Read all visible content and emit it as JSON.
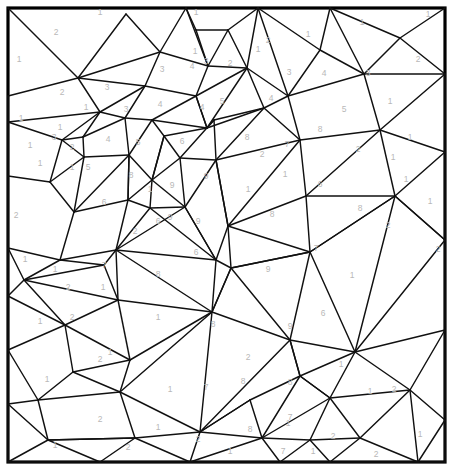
{
  "document": {
    "kind": "color-by-number-coloring-page",
    "title": "Color By Number Mosaic Grid",
    "canvas": {
      "width": 453,
      "height": 475,
      "background_color": "#ffffff"
    },
    "frame": {
      "x": 8,
      "y": 8,
      "width": 437,
      "height": 454,
      "stroke_color": "#000000",
      "stroke_width": 3.2,
      "fill_color": "#ffffff"
    },
    "style": {
      "edge_color": "#111111",
      "edge_width": 1.45,
      "number_color": "#b8b8b8",
      "number_font_size": 8.5
    },
    "palette_values": [
      "1",
      "2",
      "3",
      "4",
      "5",
      "6",
      "7",
      "8",
      "9"
    ]
  },
  "edges": [
    [
      8,
      8,
      78,
      78
    ],
    [
      78,
      78,
      8,
      96
    ],
    [
      78,
      78,
      126,
      14
    ],
    [
      126,
      14,
      160,
      52
    ],
    [
      160,
      52,
      78,
      78
    ],
    [
      160,
      52,
      186,
      8
    ],
    [
      160,
      52,
      208,
      66
    ],
    [
      208,
      66,
      186,
      8
    ],
    [
      186,
      8,
      196,
      30
    ],
    [
      196,
      30,
      208,
      66
    ],
    [
      196,
      30,
      228,
      30
    ],
    [
      228,
      30,
      208,
      66
    ],
    [
      228,
      30,
      258,
      8
    ],
    [
      228,
      30,
      247,
      68
    ],
    [
      247,
      68,
      208,
      66
    ],
    [
      208,
      66,
      196,
      96
    ],
    [
      196,
      96,
      247,
      68
    ],
    [
      196,
      96,
      207,
      128
    ],
    [
      207,
      128,
      247,
      68
    ],
    [
      247,
      68,
      264,
      108
    ],
    [
      264,
      108,
      207,
      128
    ],
    [
      207,
      128,
      196,
      96
    ],
    [
      160,
      52,
      145,
      86
    ],
    [
      145,
      86,
      196,
      96
    ],
    [
      145,
      86,
      78,
      78
    ],
    [
      145,
      86,
      100,
      112
    ],
    [
      100,
      112,
      78,
      78
    ],
    [
      100,
      112,
      8,
      122
    ],
    [
      8,
      96,
      8,
      122
    ],
    [
      100,
      112,
      125,
      118
    ],
    [
      125,
      118,
      145,
      86
    ],
    [
      125,
      118,
      152,
      120
    ],
    [
      152,
      120,
      196,
      96
    ],
    [
      152,
      120,
      207,
      128
    ],
    [
      8,
      122,
      62,
      140
    ],
    [
      62,
      140,
      100,
      112
    ],
    [
      62,
      140,
      83,
      137
    ],
    [
      83,
      137,
      100,
      112
    ],
    [
      83,
      137,
      125,
      118
    ],
    [
      83,
      137,
      84,
      157
    ],
    [
      84,
      157,
      62,
      140
    ],
    [
      84,
      157,
      129,
      155
    ],
    [
      129,
      155,
      125,
      118
    ],
    [
      129,
      155,
      152,
      120
    ],
    [
      62,
      140,
      50,
      182
    ],
    [
      50,
      182,
      84,
      157
    ],
    [
      50,
      182,
      8,
      176
    ],
    [
      8,
      122,
      8,
      176
    ],
    [
      50,
      182,
      74,
      212
    ],
    [
      74,
      212,
      84,
      157
    ],
    [
      74,
      212,
      129,
      155
    ],
    [
      129,
      155,
      128,
      200
    ],
    [
      128,
      200,
      74,
      212
    ],
    [
      128,
      200,
      129,
      155
    ],
    [
      152,
      120,
      164,
      136
    ],
    [
      164,
      136,
      207,
      128
    ],
    [
      164,
      136,
      152,
      180
    ],
    [
      152,
      180,
      129,
      155
    ],
    [
      152,
      180,
      128,
      200
    ],
    [
      152,
      180,
      164,
      136
    ],
    [
      207,
      128,
      214,
      120
    ],
    [
      214,
      120,
      264,
      108
    ],
    [
      264,
      108,
      288,
      96
    ],
    [
      288,
      96,
      247,
      68
    ],
    [
      288,
      96,
      258,
      8
    ],
    [
      258,
      8,
      247,
      68
    ],
    [
      288,
      96,
      320,
      50
    ],
    [
      320,
      50,
      258,
      8
    ],
    [
      320,
      50,
      330,
      8
    ],
    [
      320,
      50,
      364,
      74
    ],
    [
      364,
      74,
      288,
      96
    ],
    [
      330,
      8,
      364,
      74
    ],
    [
      364,
      74,
      400,
      38
    ],
    [
      400,
      38,
      330,
      8
    ],
    [
      400,
      38,
      445,
      8
    ],
    [
      400,
      38,
      445,
      74
    ],
    [
      445,
      74,
      364,
      74
    ],
    [
      364,
      74,
      380,
      130
    ],
    [
      380,
      130,
      445,
      74
    ],
    [
      445,
      74,
      445,
      118
    ],
    [
      380,
      130,
      445,
      152
    ],
    [
      445,
      118,
      445,
      152
    ],
    [
      288,
      96,
      300,
      140
    ],
    [
      300,
      140,
      380,
      130
    ],
    [
      300,
      140,
      264,
      108
    ],
    [
      214,
      120,
      216,
      160
    ],
    [
      216,
      160,
      264,
      108
    ],
    [
      216,
      160,
      300,
      140
    ],
    [
      214,
      120,
      180,
      158
    ],
    [
      180,
      158,
      216,
      160
    ],
    [
      180,
      158,
      164,
      136
    ],
    [
      180,
      158,
      152,
      180
    ],
    [
      180,
      158,
      185,
      207
    ],
    [
      185,
      207,
      152,
      180
    ],
    [
      185,
      207,
      216,
      160
    ],
    [
      152,
      180,
      150,
      208
    ],
    [
      150,
      208,
      185,
      207
    ],
    [
      150,
      208,
      128,
      200
    ],
    [
      128,
      200,
      116,
      250
    ],
    [
      116,
      250,
      150,
      208
    ],
    [
      116,
      250,
      185,
      207
    ],
    [
      74,
      212,
      60,
      260
    ],
    [
      60,
      260,
      116,
      250
    ],
    [
      60,
      260,
      8,
      248
    ],
    [
      8,
      176,
      8,
      248
    ],
    [
      8,
      248,
      24,
      280
    ],
    [
      24,
      280,
      60,
      260
    ],
    [
      60,
      260,
      104,
      265
    ],
    [
      104,
      265,
      116,
      250
    ],
    [
      24,
      280,
      104,
      265
    ],
    [
      104,
      265,
      118,
      300
    ],
    [
      118,
      300,
      24,
      280
    ],
    [
      24,
      280,
      8,
      296
    ],
    [
      8,
      248,
      8,
      296
    ],
    [
      8,
      296,
      65,
      325
    ],
    [
      65,
      325,
      118,
      300
    ],
    [
      65,
      325,
      24,
      280
    ],
    [
      185,
      207,
      216,
      260
    ],
    [
      216,
      260,
      150,
      208
    ],
    [
      216,
      260,
      116,
      250
    ],
    [
      216,
      260,
      185,
      207
    ],
    [
      216,
      160,
      228,
      226
    ],
    [
      228,
      226,
      300,
      140
    ],
    [
      228,
      226,
      216,
      260
    ],
    [
      228,
      226,
      216,
      160
    ],
    [
      300,
      140,
      306,
      196
    ],
    [
      306,
      196,
      228,
      226
    ],
    [
      306,
      196,
      380,
      130
    ],
    [
      380,
      130,
      395,
      196
    ],
    [
      395,
      196,
      306,
      196
    ],
    [
      395,
      196,
      445,
      152
    ],
    [
      445,
      152,
      445,
      240
    ],
    [
      395,
      196,
      445,
      240
    ],
    [
      306,
      196,
      310,
      252
    ],
    [
      310,
      252,
      395,
      196
    ],
    [
      310,
      252,
      228,
      226
    ],
    [
      228,
      226,
      231,
      268
    ],
    [
      231,
      268,
      310,
      252
    ],
    [
      231,
      268,
      216,
      260
    ],
    [
      216,
      260,
      212,
      312
    ],
    [
      212,
      312,
      231,
      268
    ],
    [
      212,
      312,
      116,
      250
    ],
    [
      116,
      250,
      118,
      300
    ],
    [
      118,
      300,
      212,
      312
    ],
    [
      118,
      300,
      130,
      360
    ],
    [
      130,
      360,
      212,
      312
    ],
    [
      65,
      325,
      130,
      360
    ],
    [
      65,
      325,
      73,
      372
    ],
    [
      73,
      372,
      130,
      360
    ],
    [
      8,
      296,
      8,
      350
    ],
    [
      8,
      350,
      65,
      325
    ],
    [
      8,
      350,
      38,
      400
    ],
    [
      38,
      400,
      73,
      372
    ],
    [
      38,
      400,
      8,
      404
    ],
    [
      8,
      350,
      8,
      404
    ],
    [
      38,
      400,
      120,
      392
    ],
    [
      120,
      392,
      73,
      372
    ],
    [
      120,
      392,
      130,
      360
    ],
    [
      8,
      404,
      48,
      440
    ],
    [
      48,
      440,
      38,
      400
    ],
    [
      48,
      440,
      8,
      462
    ],
    [
      8,
      404,
      8,
      462
    ],
    [
      48,
      440,
      135,
      438
    ],
    [
      135,
      438,
      120,
      392
    ],
    [
      135,
      438,
      48,
      440
    ],
    [
      48,
      440,
      100,
      462
    ],
    [
      100,
      462,
      135,
      438
    ],
    [
      8,
      462,
      100,
      462
    ],
    [
      135,
      438,
      190,
      462
    ],
    [
      100,
      462,
      190,
      462
    ],
    [
      135,
      438,
      200,
      432
    ],
    [
      200,
      432,
      190,
      462
    ],
    [
      200,
      432,
      120,
      392
    ],
    [
      120,
      392,
      212,
      312
    ],
    [
      212,
      312,
      231,
      268
    ],
    [
      212,
      312,
      290,
      340
    ],
    [
      290,
      340,
      231,
      268
    ],
    [
      290,
      340,
      200,
      432
    ],
    [
      200,
      432,
      212,
      312
    ],
    [
      231,
      268,
      310,
      252
    ],
    [
      310,
      252,
      290,
      340
    ],
    [
      290,
      340,
      355,
      352
    ],
    [
      355,
      352,
      310,
      252
    ],
    [
      310,
      252,
      395,
      196
    ],
    [
      395,
      196,
      355,
      352
    ],
    [
      355,
      352,
      445,
      240
    ],
    [
      445,
      240,
      395,
      196
    ],
    [
      445,
      240,
      445,
      330
    ],
    [
      355,
      352,
      445,
      330
    ],
    [
      290,
      340,
      300,
      376
    ],
    [
      300,
      376,
      355,
      352
    ],
    [
      300,
      376,
      290,
      340
    ],
    [
      200,
      432,
      250,
      400
    ],
    [
      250,
      400,
      300,
      376
    ],
    [
      250,
      400,
      200,
      432
    ],
    [
      250,
      400,
      262,
      438
    ],
    [
      262,
      438,
      200,
      432
    ],
    [
      190,
      462,
      262,
      438
    ],
    [
      262,
      438,
      300,
      376
    ],
    [
      300,
      376,
      330,
      398
    ],
    [
      330,
      398,
      262,
      438
    ],
    [
      330,
      398,
      300,
      376
    ],
    [
      330,
      398,
      310,
      440
    ],
    [
      310,
      440,
      262,
      438
    ],
    [
      262,
      438,
      280,
      462
    ],
    [
      280,
      462,
      310,
      440
    ],
    [
      190,
      462,
      280,
      462
    ],
    [
      310,
      440,
      330,
      462
    ],
    [
      280,
      462,
      330,
      462
    ],
    [
      310,
      440,
      360,
      438
    ],
    [
      360,
      438,
      330,
      462
    ],
    [
      360,
      438,
      330,
      398
    ],
    [
      330,
      398,
      355,
      352
    ],
    [
      355,
      352,
      410,
      390
    ],
    [
      410,
      390,
      360,
      438
    ],
    [
      410,
      390,
      330,
      398
    ],
    [
      445,
      330,
      410,
      390
    ],
    [
      410,
      390,
      445,
      420
    ],
    [
      445,
      330,
      445,
      420
    ],
    [
      410,
      390,
      418,
      462
    ],
    [
      418,
      462,
      445,
      420
    ],
    [
      360,
      438,
      418,
      462
    ],
    [
      330,
      462,
      418,
      462
    ],
    [
      418,
      462,
      445,
      462
    ],
    [
      445,
      420,
      445,
      462
    ]
  ],
  "cells": [
    {
      "n": "2",
      "x": 56,
      "y": 33
    },
    {
      "n": "1",
      "x": 100,
      "y": 13
    },
    {
      "n": "1",
      "x": 19,
      "y": 60
    },
    {
      "n": "1",
      "x": 196,
      "y": 13
    },
    {
      "n": "1",
      "x": 195,
      "y": 52
    },
    {
      "n": "2",
      "x": 268,
      "y": 41
    },
    {
      "n": "1",
      "x": 308,
      "y": 35
    },
    {
      "n": "1",
      "x": 362,
      "y": 23
    },
    {
      "n": "1",
      "x": 428,
      "y": 15
    },
    {
      "n": "2",
      "x": 62,
      "y": 93
    },
    {
      "n": "3",
      "x": 107,
      "y": 88
    },
    {
      "n": "3",
      "x": 162,
      "y": 70
    },
    {
      "n": "4",
      "x": 192,
      "y": 67
    },
    {
      "n": "3",
      "x": 206,
      "y": 62
    },
    {
      "n": "2",
      "x": 230,
      "y": 64
    },
    {
      "n": "1",
      "x": 258,
      "y": 50
    },
    {
      "n": "3",
      "x": 289,
      "y": 73
    },
    {
      "n": "4",
      "x": 324,
      "y": 74
    },
    {
      "n": "3",
      "x": 368,
      "y": 74
    },
    {
      "n": "2",
      "x": 418,
      "y": 60
    },
    {
      "n": "1",
      "x": 21,
      "y": 119
    },
    {
      "n": "1",
      "x": 86,
      "y": 108
    },
    {
      "n": "3",
      "x": 126,
      "y": 110
    },
    {
      "n": "4",
      "x": 160,
      "y": 105
    },
    {
      "n": "4",
      "x": 202,
      "y": 108
    },
    {
      "n": "5",
      "x": 222,
      "y": 102
    },
    {
      "n": "4",
      "x": 271,
      "y": 99
    },
    {
      "n": "5",
      "x": 344,
      "y": 110
    },
    {
      "n": "1",
      "x": 390,
      "y": 102
    },
    {
      "n": "1",
      "x": 30,
      "y": 146
    },
    {
      "n": "3",
      "x": 54,
      "y": 138
    },
    {
      "n": "4",
      "x": 108,
      "y": 140
    },
    {
      "n": "5",
      "x": 138,
      "y": 143
    },
    {
      "n": "6",
      "x": 182,
      "y": 142
    },
    {
      "n": "8",
      "x": 247,
      "y": 138
    },
    {
      "n": "7",
      "x": 287,
      "y": 145
    },
    {
      "n": "8",
      "x": 320,
      "y": 130
    },
    {
      "n": "1",
      "x": 410,
      "y": 138
    },
    {
      "n": "1",
      "x": 40,
      "y": 164
    },
    {
      "n": "5",
      "x": 88,
      "y": 168
    },
    {
      "n": "8",
      "x": 131,
      "y": 176
    },
    {
      "n": "9",
      "x": 172,
      "y": 186
    },
    {
      "n": "9",
      "x": 206,
      "y": 177
    },
    {
      "n": "6",
      "x": 320,
      "y": 185
    },
    {
      "n": "1",
      "x": 406,
      "y": 180
    },
    {
      "n": "2",
      "x": 16,
      "y": 216
    },
    {
      "n": "6",
      "x": 104,
      "y": 203
    },
    {
      "n": "6",
      "x": 158,
      "y": 222
    },
    {
      "n": "9",
      "x": 170,
      "y": 218
    },
    {
      "n": "9",
      "x": 198,
      "y": 222
    },
    {
      "n": "8",
      "x": 272,
      "y": 215
    },
    {
      "n": "8",
      "x": 360,
      "y": 209
    },
    {
      "n": "2",
      "x": 388,
      "y": 226
    },
    {
      "n": "1",
      "x": 430,
      "y": 202
    },
    {
      "n": "6",
      "x": 196,
      "y": 253
    },
    {
      "n": "7",
      "x": 316,
      "y": 249
    },
    {
      "n": "2",
      "x": 438,
      "y": 250
    },
    {
      "n": "7",
      "x": 104,
      "y": 266
    },
    {
      "n": "8",
      "x": 158,
      "y": 275
    },
    {
      "n": "9",
      "x": 268,
      "y": 270
    },
    {
      "n": "1",
      "x": 352,
      "y": 276
    },
    {
      "n": "1",
      "x": 25,
      "y": 260
    },
    {
      "n": "2",
      "x": 68,
      "y": 288
    },
    {
      "n": "1",
      "x": 103,
      "y": 288
    },
    {
      "n": "9",
      "x": 290,
      "y": 327
    },
    {
      "n": "6",
      "x": 323,
      "y": 314
    },
    {
      "n": "8",
      "x": 213,
      "y": 325
    },
    {
      "n": "1",
      "x": 158,
      "y": 318
    },
    {
      "n": "2",
      "x": 72,
      "y": 318
    },
    {
      "n": "1",
      "x": 40,
      "y": 322
    },
    {
      "n": "1",
      "x": 110,
      "y": 353
    },
    {
      "n": "2",
      "x": 100,
      "y": 360
    },
    {
      "n": "1",
      "x": 47,
      "y": 380
    },
    {
      "n": "2",
      "x": 248,
      "y": 358
    },
    {
      "n": "7",
      "x": 206,
      "y": 388
    },
    {
      "n": "8",
      "x": 243,
      "y": 382
    },
    {
      "n": "8",
      "x": 290,
      "y": 383
    },
    {
      "n": "1",
      "x": 341,
      "y": 365
    },
    {
      "n": "2",
      "x": 394,
      "y": 390
    },
    {
      "n": "1",
      "x": 370,
      "y": 392
    },
    {
      "n": "2",
      "x": 100,
      "y": 420
    },
    {
      "n": "1",
      "x": 158,
      "y": 428
    },
    {
      "n": "8",
      "x": 250,
      "y": 430
    },
    {
      "n": "1",
      "x": 288,
      "y": 424
    },
    {
      "n": "7",
      "x": 290,
      "y": 418
    },
    {
      "n": "2",
      "x": 333,
      "y": 437
    },
    {
      "n": "2",
      "x": 128,
      "y": 448
    },
    {
      "n": "1",
      "x": 230,
      "y": 452
    },
    {
      "n": "2",
      "x": 198,
      "y": 440
    },
    {
      "n": "7",
      "x": 283,
      "y": 452
    },
    {
      "n": "1",
      "x": 313,
      "y": 452
    },
    {
      "n": "2",
      "x": 376,
      "y": 455
    },
    {
      "n": "1",
      "x": 420,
      "y": 435
    },
    {
      "n": "1",
      "x": 55,
      "y": 446
    },
    {
      "n": "1",
      "x": 170,
      "y": 390
    },
    {
      "n": "1",
      "x": 55,
      "y": 270
    },
    {
      "n": "2",
      "x": 135,
      "y": 232
    },
    {
      "n": "1",
      "x": 150,
      "y": 190
    },
    {
      "n": "1",
      "x": 60,
      "y": 128
    },
    {
      "n": "2",
      "x": 72,
      "y": 148
    },
    {
      "n": "1",
      "x": 72,
      "y": 168
    },
    {
      "n": "1",
      "x": 285,
      "y": 175
    },
    {
      "n": "2",
      "x": 262,
      "y": 155
    },
    {
      "n": "1",
      "x": 248,
      "y": 190
    },
    {
      "n": "1",
      "x": 393,
      "y": 158
    },
    {
      "n": "2",
      "x": 358,
      "y": 150
    }
  ]
}
